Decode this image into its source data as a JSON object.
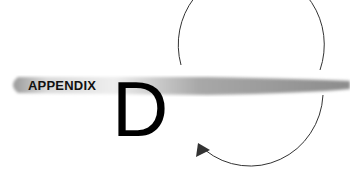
{
  "heading": {
    "label": "APPENDIX",
    "letter": "D"
  },
  "colors": {
    "band_dark": "#8a8a8a",
    "band_light": "#d8d8d8",
    "circle_stroke": "#333333",
    "text": "#111111"
  },
  "icons": [
    "cycle-arrow-icon"
  ]
}
